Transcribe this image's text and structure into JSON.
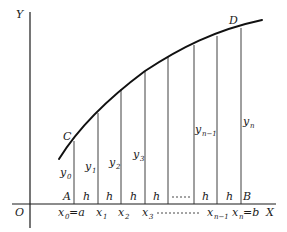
{
  "figure": {
    "axes": {
      "y_label": "Y",
      "x_label": "X",
      "origin_label": "O"
    },
    "points": {
      "C": "C",
      "D": "D",
      "A": "A",
      "B": "B"
    },
    "ordinates": [
      {
        "name": "y",
        "sub": "0"
      },
      {
        "name": "y",
        "sub": "1"
      },
      {
        "name": "y",
        "sub": "2"
      },
      {
        "name": "y",
        "sub": "3"
      },
      {
        "name": "y",
        "sub": "n−1"
      },
      {
        "name": "y",
        "sub": "n"
      }
    ],
    "strip_labels": [
      "h",
      "h",
      "h",
      "h",
      "h",
      "h"
    ],
    "strip_ellipsis": "....",
    "x_ticks": [
      {
        "name": "x",
        "sub": "0",
        "suffix": "=a"
      },
      {
        "name": "x",
        "sub": "1",
        "suffix": ""
      },
      {
        "name": "x",
        "sub": "2",
        "suffix": ""
      },
      {
        "name": "x",
        "sub": "3",
        "suffix": ""
      },
      {
        "name": "x",
        "sub": "n−1",
        "suffix": ""
      },
      {
        "name": "x",
        "sub": "n",
        "suffix": "=b"
      }
    ],
    "x_tick_dashes": "- - - - - - -",
    "colors": {
      "ink": "#1a1a1a",
      "background": "#ffffff"
    }
  }
}
